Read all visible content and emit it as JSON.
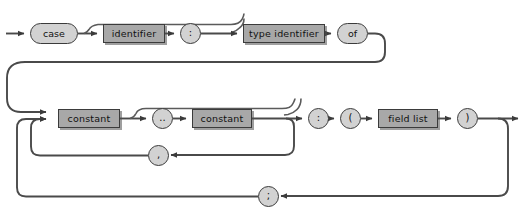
{
  "diagram": {
    "kind": "railroad-syntax-diagram",
    "colors": {
      "background": "#ffffff",
      "rail": "#4a4a4a",
      "box_fill": "#a8a8a8",
      "oval_fill": "#d2d2d2",
      "stroke": "#3b3b3b",
      "text": "#111111"
    },
    "nodes": [
      {
        "id": "case",
        "label": "case",
        "shape": "oval",
        "x": 30,
        "y": 23,
        "w": 48,
        "h": 21
      },
      {
        "id": "identifier",
        "label": "identifier",
        "shape": "box",
        "x": 103,
        "y": 24,
        "w": 62,
        "h": 19
      },
      {
        "id": "colon1",
        "label": ":",
        "shape": "circle",
        "x": 180,
        "y": 23,
        "w": 21,
        "h": 21
      },
      {
        "id": "type-identifier",
        "label": "type identifier",
        "shape": "box",
        "x": 243,
        "y": 24,
        "w": 82,
        "h": 19
      },
      {
        "id": "of",
        "label": "of",
        "shape": "oval",
        "x": 337,
        "y": 23,
        "w": 31,
        "h": 21
      },
      {
        "id": "constant1",
        "label": "constant",
        "shape": "box",
        "x": 58,
        "y": 109,
        "w": 62,
        "h": 19
      },
      {
        "id": "dotdot",
        "label": "..",
        "shape": "circle",
        "x": 152,
        "y": 108,
        "w": 21,
        "h": 21
      },
      {
        "id": "constant2",
        "label": "constant",
        "shape": "box",
        "x": 192,
        "y": 109,
        "w": 60,
        "h": 19
      },
      {
        "id": "colon2",
        "label": ":",
        "shape": "circle",
        "x": 308,
        "y": 108,
        "w": 21,
        "h": 21
      },
      {
        "id": "lparen",
        "label": "(",
        "shape": "circle",
        "x": 340,
        "y": 108,
        "w": 21,
        "h": 21
      },
      {
        "id": "field-list",
        "label": "field list",
        "shape": "box",
        "x": 378,
        "y": 109,
        "w": 60,
        "h": 19
      },
      {
        "id": "rparen",
        "label": ")",
        "shape": "circle",
        "x": 457,
        "y": 108,
        "w": 21,
        "h": 21
      },
      {
        "id": "comma",
        "label": ",",
        "shape": "circle",
        "x": 148,
        "y": 145,
        "w": 21,
        "h": 21
      },
      {
        "id": "semicolon",
        "label": ";",
        "shape": "circle",
        "x": 258,
        "y": 186,
        "w": 21,
        "h": 21
      }
    ]
  }
}
